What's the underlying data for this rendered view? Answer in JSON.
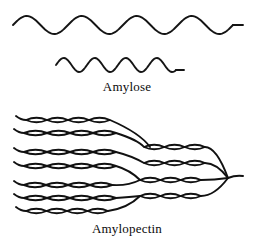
{
  "figure": {
    "type": "scientific-illustration",
    "background_color": "#ffffff",
    "ink_color": "#111111",
    "width": 254,
    "height": 245
  },
  "panels": [
    {
      "id": "amylose",
      "caption": "Amylose",
      "description": "Two unbranched wavy helical chains drawn as smooth sine curves",
      "strand_count": 2
    },
    {
      "id": "amylopectin",
      "caption": "Amylopectin",
      "description": "Branched network of helical chains drawn as rows of linked ellipses converging to a single reducing end at the right",
      "strand_count": 12
    }
  ],
  "captions": {
    "amylose": "Amylose",
    "amylopectin": "Amylopectin"
  },
  "chart_data": {
    "type": "diagram",
    "title": "",
    "amylose_waves": [
      {
        "name": "upper-strand",
        "x_start": 13,
        "x_end": 233,
        "tail_x_end": 243,
        "baseline_y": 25,
        "amplitude": 9,
        "period": 55,
        "stroke_width": 1.9
      },
      {
        "name": "lower-strand",
        "x_start": 56,
        "x_end": 176,
        "tail_x_end": 184,
        "baseline_y": 65,
        "amplitude": 7,
        "period": 31,
        "stroke_width": 1.9
      }
    ],
    "amylopectin_chains": [
      {
        "name": "chain-1",
        "y": 120,
        "x_start": 26,
        "x_end": 110,
        "units": 4,
        "tail_left": true
      },
      {
        "name": "chain-2",
        "y": 133,
        "x_start": 24,
        "x_end": 116,
        "units": 4,
        "tail_left": true
      },
      {
        "name": "chain-3",
        "y": 152,
        "x_start": 24,
        "x_end": 116,
        "units": 4,
        "tail_left": true
      },
      {
        "name": "chain-4",
        "y": 166,
        "x_start": 24,
        "x_end": 116,
        "units": 4,
        "tail_left": true
      },
      {
        "name": "chain-5",
        "y": 185,
        "x_start": 24,
        "x_end": 112,
        "units": 4,
        "tail_left": true
      },
      {
        "name": "chain-6",
        "y": 198,
        "x_start": 24,
        "x_end": 116,
        "units": 4,
        "tail_left": true
      },
      {
        "name": "chain-7",
        "y": 211,
        "x_start": 26,
        "x_end": 108,
        "units": 4,
        "tail_left": true
      },
      {
        "name": "branch-chain-a",
        "y": 147,
        "x_start": 144,
        "x_end": 205,
        "units": 3,
        "tail_left": false
      },
      {
        "name": "branch-chain-b",
        "y": 163,
        "x_start": 144,
        "x_end": 205,
        "units": 3,
        "tail_left": false
      },
      {
        "name": "branch-chain-c",
        "y": 180,
        "x_start": 140,
        "x_end": 201,
        "units": 3,
        "tail_left": false
      },
      {
        "name": "branch-chain-d",
        "y": 196,
        "x_start": 140,
        "x_end": 201,
        "units": 3,
        "tail_left": false
      }
    ],
    "convergence_point": {
      "x": 228,
      "y": 178
    },
    "reducing_end_tail": {
      "x_start": 228,
      "x_end": 243,
      "y": 178
    },
    "xlabel": "",
    "ylabel": "",
    "legend": []
  }
}
